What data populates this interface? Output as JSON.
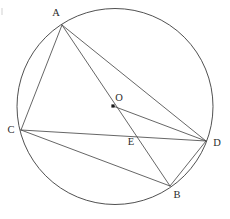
{
  "diagram": {
    "canvas": {
      "width": 230,
      "height": 219
    },
    "stroke_color": "#4a4a4a",
    "circle_color": "#3c3c3c",
    "label_color": "#2b2b2b",
    "background": "#ffffff",
    "circle": {
      "name": "circumscribed-circle",
      "cx": 115,
      "cy": 106.5,
      "r": 98
    },
    "center_point": {
      "label": "O",
      "x": 113,
      "y": 106,
      "label_x": 119,
      "label_y": 99
    },
    "points": [
      {
        "label": "A",
        "x": 62,
        "y": 25,
        "label_x": 56,
        "label_y": 14
      },
      {
        "label": "B",
        "x": 170,
        "y": 186,
        "label_x": 177,
        "label_y": 196
      },
      {
        "label": "C",
        "x": 21,
        "y": 130,
        "label_x": 11,
        "label_y": 131
      },
      {
        "label": "D",
        "x": 206,
        "y": 141,
        "label_x": 217,
        "label_y": 144
      },
      {
        "label": "E",
        "x": 138,
        "y": 133,
        "label_x": 131,
        "label_y": 143
      }
    ],
    "segments": [
      {
        "name": "segment-AC",
        "from": "A",
        "to": "C",
        "x1": 62,
        "y1": 25,
        "x2": 21,
        "y2": 130
      },
      {
        "name": "segment-AD",
        "from": "A",
        "to": "D",
        "x1": 62,
        "y1": 25,
        "x2": 206,
        "y2": 141
      },
      {
        "name": "segment-AB",
        "from": "A",
        "to": "B",
        "x1": 62,
        "y1": 25,
        "x2": 170,
        "y2": 186
      },
      {
        "name": "segment-CD",
        "from": "C",
        "to": "D",
        "x1": 21,
        "y1": 130,
        "x2": 206,
        "y2": 141
      },
      {
        "name": "segment-CB",
        "from": "C",
        "to": "B",
        "x1": 21,
        "y1": 130,
        "x2": 170,
        "y2": 186
      },
      {
        "name": "segment-BD",
        "from": "B",
        "to": "D",
        "x1": 170,
        "y1": 186,
        "x2": 206,
        "y2": 141
      },
      {
        "name": "segment-OD",
        "from": "O",
        "to": "D",
        "x1": 113,
        "y1": 106,
        "x2": 206,
        "y2": 141
      }
    ]
  }
}
